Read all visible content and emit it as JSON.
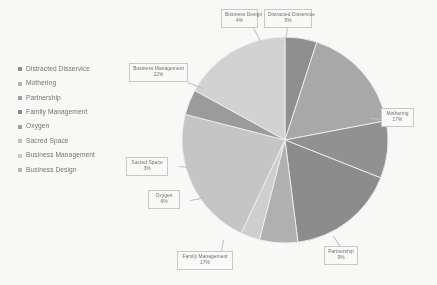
{
  "chart_data": {
    "type": "pie",
    "title": "",
    "legend_position": "left",
    "grid": false,
    "value_suffix": "%",
    "categories": [
      "Distracted Disservice",
      "Mothering",
      "Partnership",
      "Family Management",
      "Oxygen",
      "Sacred Space",
      "Business Management",
      "Business Design"
    ],
    "values": [
      5,
      17,
      9,
      17,
      6,
      3,
      22,
      4
    ],
    "colors": [
      "#8c8c8c",
      "#a8a8a8",
      "#8f8f8f",
      "#8a8a8a",
      "#b0b0b0",
      "#d0d0d0",
      "#c6c6c6",
      "#9a9a9a"
    ],
    "labels": [
      {
        "name": "Distracted Disservice",
        "value": "5%"
      },
      {
        "name": "Mothering",
        "value": "17%"
      },
      {
        "name": "Partnership",
        "value": "9%"
      },
      {
        "name": "Family Management",
        "value": "17%"
      },
      {
        "name": "Oxygen",
        "value": "6%"
      },
      {
        "name": "Sacred Space",
        "value": "3%"
      },
      {
        "name": "Business Management",
        "value": "22%"
      },
      {
        "name": "Business Design",
        "value": "4%"
      }
    ]
  },
  "legend": {
    "items": [
      {
        "label": "Distracted Disservice",
        "color": "#8c8c8c"
      },
      {
        "label": "Mothering",
        "color": "#b4b4b4"
      },
      {
        "label": "Partnership",
        "color": "#a0a0a0"
      },
      {
        "label": "Family Management",
        "color": "#878787"
      },
      {
        "label": "Oxygen",
        "color": "#9e9e9e"
      },
      {
        "label": "Sacred Space",
        "color": "#c2c2c2"
      },
      {
        "label": "Business Management",
        "color": "#cfcfcf"
      },
      {
        "label": "Business Design",
        "color": "#b8b8b8"
      }
    ]
  }
}
